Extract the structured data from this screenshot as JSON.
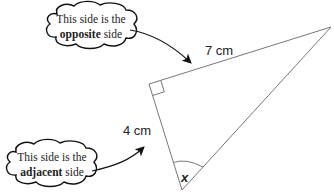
{
  "diagram": {
    "type": "right-triangle",
    "vertices": {
      "right_angle": [
        149,
        84
      ],
      "top": [
        331,
        27
      ],
      "bottom": [
        182,
        190
      ]
    },
    "labels": {
      "opposite_length": "7 cm",
      "adjacent_length": "4 cm",
      "angle": "x"
    },
    "callouts": {
      "opposite": {
        "line1": "This side is the",
        "bold": "opposite",
        "rest": " side"
      },
      "adjacent": {
        "line1": "This side is the",
        "bold": "adjacent",
        "rest": " side"
      }
    },
    "colors": {
      "line": "#777777",
      "text": "#222222",
      "cloud": "#111111"
    }
  }
}
